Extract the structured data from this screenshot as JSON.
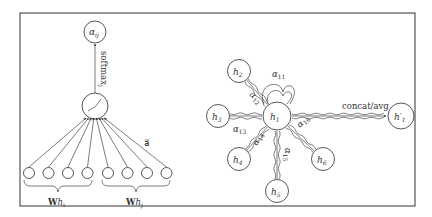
{
  "left_panel": {
    "output_node": "α",
    "output_sub": "ij",
    "arrow_label": "softmax",
    "arrow_label_sub": "j",
    "attention_vector_label": "a⃗",
    "group_left_label": "W",
    "group_left_h": "h",
    "group_left_sub": "i",
    "group_right_label": "W",
    "group_right_h": "h",
    "group_right_sub": "j",
    "input_node_count": 8
  },
  "right_panel": {
    "center_node": {
      "h": "h",
      "sub": "1"
    },
    "neighbors": [
      {
        "id": "h2",
        "h": "h",
        "sub": "2"
      },
      {
        "id": "h3",
        "h": "h",
        "sub": "3"
      },
      {
        "id": "h4",
        "h": "h",
        "sub": "4"
      },
      {
        "id": "h5",
        "h": "h",
        "sub": "5"
      },
      {
        "id": "h6",
        "h": "h",
        "sub": "6"
      }
    ],
    "output_node": {
      "h": "h′",
      "sub": "1"
    },
    "output_edge_label": "concat/avg",
    "attention_labels": [
      {
        "a": "α",
        "sub": "11"
      },
      {
        "a": "α",
        "sub": "12"
      },
      {
        "a": "α",
        "sub": "13"
      },
      {
        "a": "α",
        "sub": "14"
      },
      {
        "a": "α",
        "sub": "15"
      },
      {
        "a": "α",
        "sub": "16"
      }
    ]
  }
}
